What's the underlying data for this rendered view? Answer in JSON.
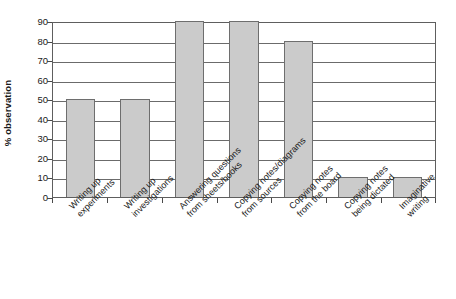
{
  "chart_data": {
    "type": "bar",
    "title": "",
    "xlabel": "",
    "ylabel": "% observation",
    "ylim": [
      0,
      90
    ],
    "ytick_step": 10,
    "grid": true,
    "legend": "none",
    "orientation": "vertical",
    "bar_color": "#cbcbcb",
    "bar_border_color": "#6e6e6e",
    "categories": [
      "Writing up experiments",
      "Writing up investigations",
      "Answering questions from sheets/books",
      "Copying notes/diagrams from sources",
      "Copying notes from the board",
      "Copying notes being dictated",
      "Imaginative writing"
    ],
    "category_lines": [
      [
        "Writing up",
        "experiments"
      ],
      [
        "Writing up",
        "investigations"
      ],
      [
        "Answering questions",
        "from sheets/books"
      ],
      [
        "Copying notes/diagrams",
        "from sources"
      ],
      [
        "Copying notes",
        "from the board"
      ],
      [
        "Copying notes",
        "being dictated"
      ],
      [
        "Imaginative",
        "writing"
      ]
    ],
    "values": [
      50,
      50,
      90,
      90,
      80,
      10,
      10
    ],
    "ytick_labels": [
      "90",
      "80",
      "70",
      "60",
      "50",
      "40",
      "30",
      "20",
      "10",
      "0"
    ],
    "ytick_values": [
      90,
      80,
      70,
      60,
      50,
      40,
      30,
      20,
      10,
      0
    ]
  }
}
